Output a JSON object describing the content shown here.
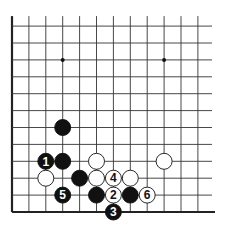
{
  "board": {
    "grid": {
      "origin_x": 12,
      "origin_y": 25,
      "spacing": 16.9,
      "cols": 12,
      "rows": 12,
      "right_end": 212,
      "bottom_y": 212,
      "left_edge": true,
      "bottom_edge": true
    },
    "colors": {
      "line": "#333333",
      "black": "#111111",
      "white": "#ffffff",
      "edge": "#222222"
    },
    "star_points": [
      {
        "col": 3,
        "row": 2
      },
      {
        "col": 9,
        "row": 2
      }
    ],
    "stones": [
      {
        "color": "black",
        "col": 3,
        "row": 6,
        "label": ""
      },
      {
        "color": "black",
        "col": 2,
        "row": 8,
        "label": "1"
      },
      {
        "color": "black",
        "col": 3,
        "row": 8,
        "label": ""
      },
      {
        "color": "white",
        "col": 5,
        "row": 8,
        "label": ""
      },
      {
        "color": "white",
        "col": 9,
        "row": 8,
        "label": ""
      },
      {
        "color": "white",
        "col": 2,
        "row": 9,
        "label": ""
      },
      {
        "color": "black",
        "col": 4,
        "row": 9,
        "label": ""
      },
      {
        "color": "white",
        "col": 5,
        "row": 9,
        "label": ""
      },
      {
        "color": "white",
        "col": 6,
        "row": 9,
        "label": "4"
      },
      {
        "color": "white",
        "col": 7,
        "row": 9,
        "label": ""
      },
      {
        "color": "black",
        "col": 3,
        "row": 10,
        "label": "5"
      },
      {
        "color": "black",
        "col": 5,
        "row": 10,
        "label": ""
      },
      {
        "color": "white",
        "col": 6,
        "row": 10,
        "label": "2"
      },
      {
        "color": "black",
        "col": 7,
        "row": 10,
        "label": ""
      },
      {
        "color": "white",
        "col": 8,
        "row": 10,
        "label": "6"
      },
      {
        "color": "black",
        "col": 6,
        "row": 11,
        "label": "3"
      }
    ]
  }
}
